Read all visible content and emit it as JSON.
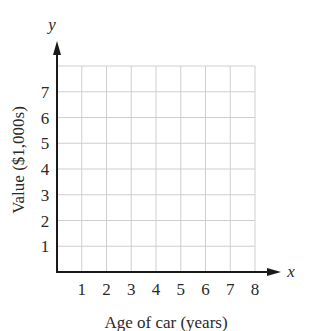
{
  "chart_data": {
    "type": "line",
    "title": "",
    "xlabel": "Age of car (years)",
    "ylabel": "Value ($1,000s)",
    "x_axis_var": "x",
    "y_axis_var": "y",
    "x_ticks": [
      "1",
      "2",
      "3",
      "4",
      "5",
      "6",
      "7",
      "8"
    ],
    "y_ticks": [
      "1",
      "2",
      "3",
      "4",
      "5",
      "6",
      "7"
    ],
    "xlim": [
      0,
      8
    ],
    "ylim": [
      0,
      8
    ],
    "grid": true,
    "series": [],
    "legend": null
  },
  "colors": {
    "axis": "#1a1a1a",
    "grid": "#cfcfcf",
    "text": "#2a2a2a"
  }
}
